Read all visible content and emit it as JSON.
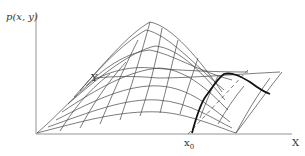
{
  "figure": {
    "y_axis_label": "p(x, y)",
    "x_axis_label": "X",
    "y_dir_label": "Y",
    "slice_label": "x",
    "slice_subscript": "0"
  },
  "colors": {
    "mesh": "#444444",
    "axes": "#888888",
    "slice": "#111111",
    "background": "#ffffff"
  }
}
